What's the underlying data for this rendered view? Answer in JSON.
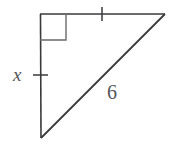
{
  "figure": {
    "type": "right-triangle-diagram",
    "background_color": "#ffffff",
    "stroke_color": "#3a3a3c",
    "label_color": "#55565a",
    "labels": {
      "leg_vertical": "x",
      "hypotenuse": "6"
    },
    "marks": {
      "right_angle": "right-angle-square",
      "tick_top_edge": "single-tick",
      "tick_left_leg": "single-tick"
    },
    "geometry": {
      "vertex_top_left": [
        40,
        14
      ],
      "vertex_top_right": [
        165,
        14
      ],
      "vertex_bottom_left": [
        41,
        138
      ],
      "right_angle_square": [
        40,
        14,
        26,
        26
      ],
      "tick_top_x": 102,
      "tick_left_y": 75
    }
  }
}
